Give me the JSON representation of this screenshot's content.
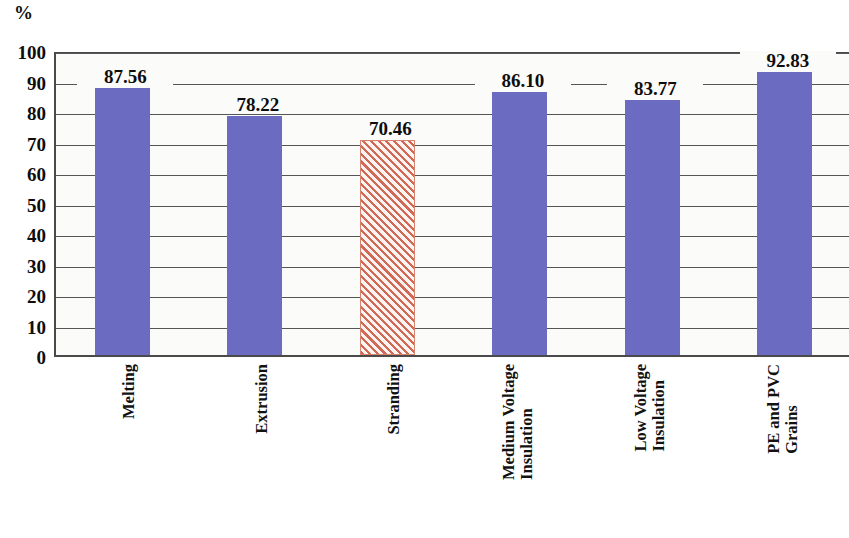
{
  "axis": {
    "unit_label": "%",
    "y_ticks": [
      "100",
      "90",
      "80",
      "70",
      "60",
      "50",
      "40",
      "30",
      "20",
      "10",
      "0"
    ]
  },
  "colors": {
    "bar_solid": "#6b6bc2",
    "bar_hatch": "#d06a57",
    "gridline": "#555555",
    "plot_background": "#fbfbf9",
    "text": "#0d0d0d"
  },
  "chart_data": {
    "type": "bar",
    "title": "",
    "xlabel": "",
    "ylabel": "%",
    "ylim": [
      0,
      100
    ],
    "ytick_step": 10,
    "grid": true,
    "legend": "none",
    "categories": [
      "Melting",
      "Extrusion",
      "Stranding",
      "Medium Voltage Insulation",
      "Low Voltage Insulation",
      "PE and PVC Grains"
    ],
    "category_lines": [
      [
        "Melting"
      ],
      [
        "Extrusion"
      ],
      [
        "Stranding"
      ],
      [
        "Medium Voltage",
        "Insulation"
      ],
      [
        "Low Voltage",
        "Insulation"
      ],
      [
        "PE and PVC",
        "Grains"
      ]
    ],
    "values": [
      87.56,
      78.22,
      70.46,
      86.1,
      83.77,
      92.83
    ],
    "value_labels": [
      "87.56",
      "78.22",
      "70.46",
      "86.10",
      "83.77",
      "92.83"
    ],
    "bar_styles": [
      "solid",
      "solid",
      "hatched",
      "solid",
      "solid",
      "solid"
    ]
  }
}
